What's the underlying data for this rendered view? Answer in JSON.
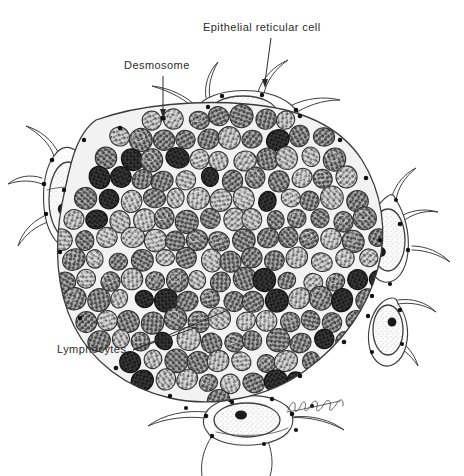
{
  "figure": {
    "name": "thymus-lobule-cross-section",
    "caption": "",
    "background_color": "#ffffff",
    "ink_color": "#2b2b2b",
    "width": 464,
    "height": 476
  },
  "labels": [
    {
      "id": "epithelial-reticular-cell",
      "text": "Epithelial reticular cell",
      "x": 203,
      "y": 22,
      "leader": {
        "from": [
          271,
          38
        ],
        "to": [
          265,
          84
        ]
      }
    },
    {
      "id": "desmosome",
      "text": "Desmosome",
      "x": 124,
      "y": 60,
      "leader": {
        "from": [
          163,
          74
        ],
        "to": [
          163,
          118
        ]
      }
    },
    {
      "id": "lymphocytes",
      "text": "Lymphocytes",
      "x": 57,
      "y": 344,
      "leaders": [
        {
          "from": [
            133,
            350
          ],
          "to": [
            196,
            327
          ]
        },
        {
          "from": [
            133,
            350
          ],
          "to": [
            226,
            311
          ]
        }
      ]
    }
  ],
  "signature": {
    "id": "artist-signature",
    "text": "",
    "x": 292,
    "y": 404,
    "style": "cursive-scribble"
  },
  "legend_keys": {
    "epithelial_reticular_cell": "Large pale stellate cell at lobule periphery with vesicular nucleus and dark nucleolus",
    "desmosome": "Small dense dot along cell membranes joining reticular cell processes",
    "lymphocyte": "Small round densely packed cell with mottled heterochromatin; darkest cells are the labelled lymphocytes"
  },
  "colors": {
    "outline": "#3a3a3a",
    "lymphocyte_light": "#b9b9b9",
    "lymphocyte_mid": "#8c8c8c",
    "lymphocyte_dark": "#2e2e2e",
    "epithelial_fill": "#fafafa",
    "nucleolus": "#1a1a1a",
    "desmosome_dot": "#111111",
    "label": "#2b2b2b"
  },
  "counts": {
    "peripheral_epithelial_cells": 6,
    "lymphocytes_approx": 190,
    "dark_lymphocytes_approx": 22,
    "desmosome_dots_approx": 46
  }
}
